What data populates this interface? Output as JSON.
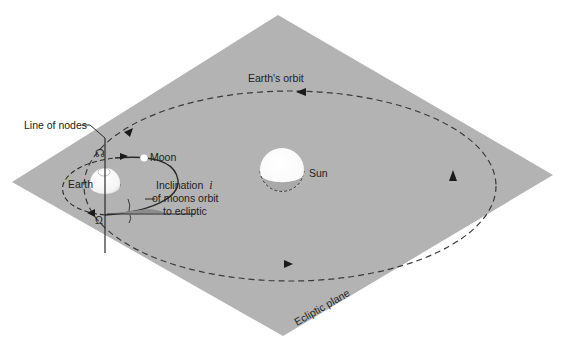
{
  "figure": {
    "type": "orbital-diagram",
    "colors": {
      "background": "#ffffff",
      "ecliptic_plane": "#b3b3b3",
      "lines": "#2a2a2a",
      "bodies": "#ffffff"
    }
  },
  "labels": {
    "earths_orbit": "Earth's orbit",
    "line_of_nodes": "Line of nodes",
    "moon": "Moon",
    "earth": "Earth",
    "sun": "Sun",
    "inclination_line1": "Inclination",
    "inclination_symbol": "i",
    "inclination_line2": "of moons orbit",
    "inclination_line3": "to ecliptic",
    "ecliptic_plane": "Ecliptic plane",
    "ascending_node_symbol": "☊",
    "descending_node_symbol": "Ω"
  }
}
